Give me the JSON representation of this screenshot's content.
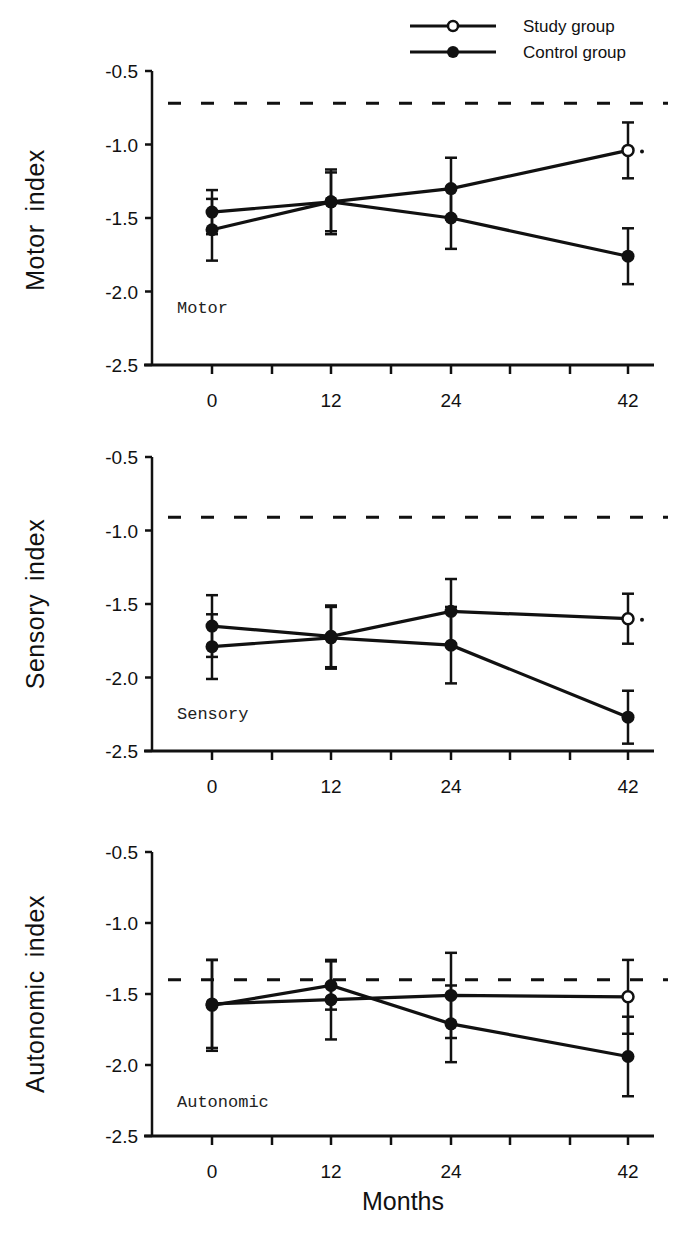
{
  "legend": {
    "items": [
      {
        "label": "Study group",
        "marker": "open-circle"
      },
      {
        "label": "Control group",
        "marker": "filled-circle"
      }
    ]
  },
  "xlabel": "Months",
  "colors": {
    "ink": "#111111",
    "background": "#ffffff"
  },
  "chart_data": [
    {
      "type": "line",
      "title": "Motor",
      "xlabel": "Months",
      "ylabel": "Motor index",
      "x": [
        0,
        12,
        24,
        42
      ],
      "xticks": [
        "0",
        "12",
        "24",
        "42"
      ],
      "yticks": [
        "-0.5",
        "-1.0",
        "-1.5",
        "-2.0",
        "-2.5"
      ],
      "ylim": [
        -2.5,
        -0.5
      ],
      "reference_line": -0.72,
      "series": [
        {
          "name": "Study group",
          "values": [
            -1.58,
            -1.39,
            -1.3,
            -1.04
          ],
          "err": [
            0.21,
            0.22,
            0.21,
            0.19
          ],
          "significance_marker_at_end": "*"
        },
        {
          "name": "Control group",
          "values": [
            -1.46,
            -1.39,
            -1.5,
            -1.76
          ],
          "err": [
            0.15,
            0.2,
            0.21,
            0.19
          ]
        }
      ],
      "grid": false
    },
    {
      "type": "line",
      "title": "Sensory",
      "xlabel": "Months",
      "ylabel": "Sensory index",
      "x": [
        0,
        12,
        24,
        42
      ],
      "xticks": [
        "0",
        "12",
        "24",
        "42"
      ],
      "yticks": [
        "-0.5",
        "-1.0",
        "-1.5",
        "-2.0",
        "-2.5"
      ],
      "ylim": [
        -2.5,
        -0.5
      ],
      "reference_line": -0.91,
      "series": [
        {
          "name": "Study group",
          "values": [
            -1.65,
            -1.72,
            -1.55,
            -1.6
          ],
          "err": [
            0.21,
            0.21,
            0.22,
            0.17
          ],
          "significance_marker_at_end": "*"
        },
        {
          "name": "Control group",
          "values": [
            -1.79,
            -1.73,
            -1.78,
            -2.27
          ],
          "err": [
            0.22,
            0.21,
            0.26,
            0.18
          ]
        }
      ],
      "grid": false
    },
    {
      "type": "line",
      "title": "Autonomic",
      "xlabel": "Months",
      "ylabel": "Autonomic index",
      "x": [
        0,
        12,
        24,
        42
      ],
      "xticks": [
        "0",
        "12",
        "24",
        "42"
      ],
      "yticks": [
        "-0.5",
        "-1.0",
        "-1.5",
        "-2.0",
        "-2.5"
      ],
      "ylim": [
        -2.5,
        -0.5
      ],
      "reference_line": -1.4,
      "series": [
        {
          "name": "Study group",
          "values": [
            -1.57,
            -1.54,
            -1.51,
            -1.52
          ],
          "err": [
            0.31,
            0.28,
            0.3,
            0.26
          ]
        },
        {
          "name": "Control group",
          "values": [
            -1.58,
            -1.44,
            -1.71,
            -1.94
          ],
          "err": [
            0.32,
            0.17,
            0.27,
            0.28
          ]
        }
      ],
      "grid": false
    }
  ]
}
